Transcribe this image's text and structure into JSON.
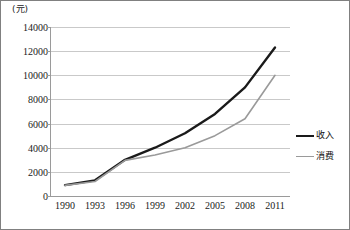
{
  "chart_data": {
    "type": "line",
    "title": "",
    "unit_label": "(元)",
    "xlabel": "",
    "ylabel": "",
    "categories": [
      "1990",
      "1993",
      "1996",
      "1999",
      "2002",
      "2005",
      "2008",
      "2011"
    ],
    "ylim": [
      0,
      14000
    ],
    "ytick_step": 2000,
    "yticks": [
      "14000",
      "12000",
      "10000",
      "8000",
      "6000",
      "4000",
      "2000",
      "0"
    ],
    "grid": true,
    "grid_orientation": "horizontal",
    "legend_position": "right",
    "series": [
      {
        "name": "收入",
        "color": "#1a1a1a",
        "width": 2.4,
        "values": [
          900,
          1300,
          3000,
          4000,
          5200,
          6800,
          9000,
          12300
        ]
      },
      {
        "name": "消费",
        "color": "#9a9a9a",
        "width": 1.6,
        "values": [
          880,
          1200,
          2950,
          3400,
          4000,
          5000,
          6400,
          10000
        ]
      }
    ]
  },
  "frame": {
    "border_color": "#808080",
    "grid_color": "#c9c9c9",
    "axis_color": "#9a9a9a",
    "background": "#ffffff"
  }
}
